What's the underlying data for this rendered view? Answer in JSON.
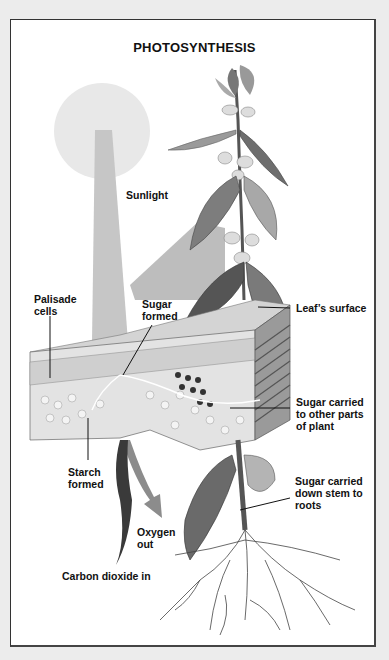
{
  "diagram": {
    "title": "PHOTOSYNTHESIS",
    "labels": {
      "sunlight": "Sunlight",
      "palisade_cells": "Palisade\ncells",
      "sugar_formed": "Sugar\nformed",
      "leaf_surface": "Leaf’s surface",
      "sugar_carried_other": "Sugar carried\nto other parts\nof plant",
      "starch_formed": "Starch\nformed",
      "sugar_carried_roots": "Sugar carried\ndown stem to\nroots",
      "oxygen_out": "Oxygen\nout",
      "carbon_dioxide_in": "Carbon dioxide in"
    },
    "elements": [
      "sun",
      "sunlight-beam",
      "plant",
      "leaf-cross-section",
      "oxygen-arrow",
      "carbon-dioxide-arrow",
      "roots"
    ],
    "colors": {
      "background": "#ececec",
      "panel": "#ffffff",
      "sun": "#e8e8e8",
      "beam": "#c6c6c6",
      "text": "#111111"
    }
  }
}
